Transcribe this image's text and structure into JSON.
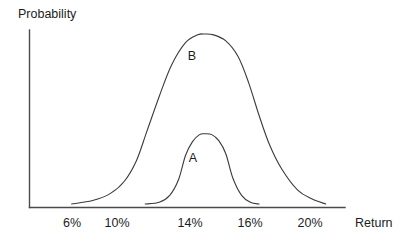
{
  "chart_data": {
    "type": "line",
    "title": "",
    "subtitle": "",
    "xlabel": "Return",
    "ylabel": "Probability",
    "grid": false,
    "legend_position": "inline-annotations",
    "xlim": [
      4,
      22
    ],
    "ylim": [
      0,
      1
    ],
    "x_tick_labels": [
      "6%",
      "10%",
      "14%",
      "16%",
      "20%"
    ],
    "x_tick_values": [
      6,
      10,
      14,
      16,
      20
    ],
    "y_tick_labels": [],
    "annotations": [
      {
        "text": "A",
        "x": 14,
        "y": 0.33
      },
      {
        "text": "B",
        "x": 14,
        "y": 0.84
      }
    ],
    "series": [
      {
        "name": "A",
        "label": "A",
        "description": "Narrow flat-topped probability distribution, lower peak",
        "center": 14,
        "peak_height": 0.42,
        "x_start": 10.6,
        "x_end": 17.1,
        "x": [
          10.6,
          11.4,
          12.0,
          12.5,
          12.9,
          13.3,
          13.7,
          14.0,
          14.4,
          14.8,
          15.2,
          15.6,
          16.1,
          16.6,
          17.1
        ],
        "y": [
          0.02,
          0.03,
          0.07,
          0.16,
          0.3,
          0.38,
          0.42,
          0.425,
          0.42,
          0.385,
          0.31,
          0.17,
          0.07,
          0.03,
          0.02
        ]
      },
      {
        "name": "B",
        "label": "B",
        "description": "Broad flat-topped probability distribution, higher peak",
        "center": 14,
        "peak_height": 1.0,
        "x_start": 6.4,
        "x_end": 20.9,
        "x": [
          6.4,
          7.6,
          8.6,
          9.4,
          10.1,
          10.7,
          11.4,
          12.1,
          12.9,
          13.6,
          14.0,
          14.5,
          15.2,
          15.9,
          16.5,
          17.1,
          17.7,
          18.4,
          19.3,
          20.1,
          20.9
        ],
        "y": [
          0.02,
          0.04,
          0.08,
          0.15,
          0.27,
          0.44,
          0.64,
          0.82,
          0.95,
          0.995,
          1.0,
          0.995,
          0.96,
          0.87,
          0.72,
          0.53,
          0.36,
          0.22,
          0.1,
          0.05,
          0.02
        ]
      }
    ]
  },
  "colors": {
    "curve_stroke": "#3a3a3a",
    "axis_stroke": "#4a4a4a",
    "text": "#1c1c1c",
    "background": "#ffffff"
  }
}
